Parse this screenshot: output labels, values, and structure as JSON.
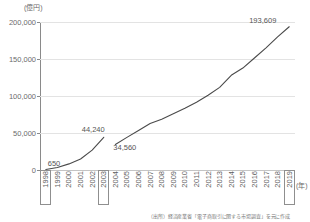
{
  "chart_data": {
    "type": "line",
    "title": "",
    "xlabel": "(年)",
    "ylabel": "(億円)",
    "ylim": [
      0,
      200000
    ],
    "yticks": [
      0,
      50000,
      100000,
      150000,
      200000
    ],
    "ytick_labels": [
      "0",
      "50,000",
      "100,000",
      "150,000",
      "200,000"
    ],
    "grid": true,
    "legend": false,
    "categories": [
      "1998",
      "1999",
      "2000",
      "2001",
      "2002",
      "2003",
      "2004",
      "2005",
      "2006",
      "2007",
      "2008",
      "2009",
      "2010",
      "2011",
      "2012",
      "2013",
      "2014",
      "2015",
      "2016",
      "2017",
      "2018",
      "2019"
    ],
    "series": [
      {
        "name": "BtoC-EC市場規模（旧基準 1998-2003）",
        "x": [
          "1998",
          "1999",
          "2000",
          "2001",
          "2002",
          "2003"
        ],
        "values": [
          650,
          3360,
          8240,
          14800,
          26850,
          44240
        ]
      },
      {
        "name": "BtoC-EC市場規模（新基準 2004-2019）",
        "x": [
          "2004",
          "2005",
          "2006",
          "2007",
          "2008",
          "2009",
          "2010",
          "2011",
          "2012",
          "2013",
          "2014",
          "2015",
          "2016",
          "2017",
          "2018",
          "2019"
        ],
        "values": [
          34560,
          44080,
          53440,
          62780,
          68700,
          75960,
          83350,
          91500,
          101000,
          111660,
          127970,
          137750,
          151358,
          165054,
          179845,
          193609
        ]
      }
    ],
    "annotations": [
      {
        "id": "start-1998",
        "label": "650",
        "year": "1998",
        "value": 650
      },
      {
        "id": "peak-2003",
        "label": "44,240",
        "year": "2003",
        "value": 44240
      },
      {
        "id": "rebase-2004",
        "label": "34,560",
        "year": "2004",
        "value": 34560
      },
      {
        "id": "end-2019",
        "label": "193,609",
        "year": "2019",
        "value": 193609
      }
    ],
    "highlighted_years": [
      "1998",
      "2003",
      "2019"
    ],
    "colors": {
      "line": "#4a4a4a",
      "gridline": "#e3e3e3",
      "axis": "#8a8a8a",
      "text": "#5b5b5b",
      "background": "#ffffff"
    }
  },
  "axes": {
    "y_unit": "(億円)",
    "x_unit": "(年)"
  },
  "source": {
    "note": "（出所）経済産業省「電子商取引に関する市場調査」を元に作成"
  }
}
